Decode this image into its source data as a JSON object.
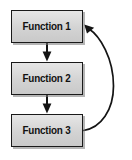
{
  "diagram": {
    "type": "flowchart",
    "title": "",
    "background_color": "#ffffff",
    "node_fill_color": "#d6d6d6",
    "node_border_color": "#1a1a1a",
    "text_color": "#111111",
    "arrow_color": "#141414",
    "nodes": [
      {
        "id": "function-1",
        "label": "Function 1"
      },
      {
        "id": "function-2",
        "label": "Function 2"
      },
      {
        "id": "function-3",
        "label": "Function 3"
      }
    ],
    "edges": [
      {
        "id": "edge-1-to-2",
        "from": "Function 1",
        "to": "Function 2",
        "style": "straight-down",
        "arrowhead": "down"
      },
      {
        "id": "edge-2-to-3",
        "from": "Function 2",
        "to": "Function 3",
        "style": "straight-down",
        "arrowhead": "down"
      },
      {
        "id": "edge-3-to-1",
        "from": "Function 3",
        "to": "Function 1",
        "style": "curved-return-right",
        "arrowhead": "up-left"
      }
    ]
  }
}
